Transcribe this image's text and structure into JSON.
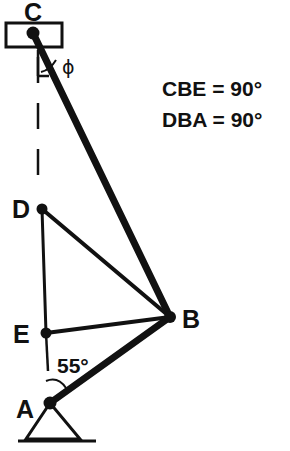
{
  "figure": {
    "background": "#ffffff",
    "ink_color": "#111111"
  },
  "labels": {
    "c": "C",
    "d": "D",
    "e": "E",
    "a": "A",
    "b": "B",
    "phi": "ϕ",
    "angle_a": "55°"
  },
  "notes": {
    "line1": "CBE = 90°",
    "line2": "DBA = 90°"
  },
  "points": {
    "C": {
      "x": 33,
      "y": 33
    },
    "D": {
      "x": 42,
      "y": 209
    },
    "E": {
      "x": 46,
      "y": 333
    },
    "B": {
      "x": 170,
      "y": 317
    },
    "A": {
      "x": 50,
      "y": 403
    }
  },
  "members": [
    {
      "name": "CB",
      "from": "C",
      "to": "B",
      "weight": "thick"
    },
    {
      "name": "AB",
      "from": "A",
      "to": "B",
      "weight": "thick"
    },
    {
      "name": "DB",
      "from": "D",
      "to": "B",
      "weight": "med"
    },
    {
      "name": "EB",
      "from": "E",
      "to": "B",
      "weight": "med"
    },
    {
      "name": "DE",
      "from": "D",
      "to": "E",
      "weight": "thin"
    }
  ],
  "annotations": {
    "vertical_reference": "dashed vertical line through C",
    "phi_angle": "angle between vertical reference and rod CB at C",
    "a_angle": "angle between vertical reference at E and rod AB at A"
  }
}
